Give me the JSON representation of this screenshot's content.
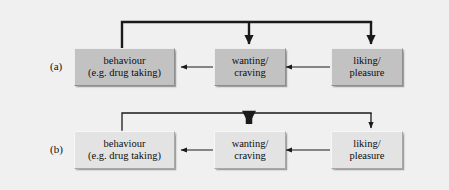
{
  "figure": {
    "background_color": "#f0f0f0",
    "width": 449,
    "height": 190,
    "stroke_color": "#1a1a1a",
    "box_fill_dark": "#c2c2c2",
    "box_fill_light": "#e3e3e3"
  },
  "rows": [
    {
      "id": "a",
      "label": "(a)",
      "tone": "dark",
      "nodes": [
        {
          "id": "behaviour",
          "line1": "behaviour",
          "line2": "(e.g. drug taking)"
        },
        {
          "id": "wanting",
          "line1": "wanting/",
          "line2": "craving"
        },
        {
          "id": "liking",
          "line1": "liking/",
          "line2": "pleasure"
        }
      ],
      "arrow_weights": {
        "liking_to_wanting": "thin",
        "wanting_to_behaviour": "thin",
        "feedback_trunk": "thick",
        "feedback_to_wanting": "thick",
        "feedback_to_liking": "thick"
      }
    },
    {
      "id": "b",
      "label": "(b)",
      "tone": "light",
      "nodes": [
        {
          "id": "behaviour",
          "line1": "behaviour",
          "line2": "(e.g. drug taking)"
        },
        {
          "id": "wanting",
          "line1": "wanting/",
          "line2": "craving"
        },
        {
          "id": "liking",
          "line1": "liking/",
          "line2": "pleasure"
        }
      ],
      "arrow_weights": {
        "liking_to_wanting": "thin",
        "wanting_to_behaviour": "thin",
        "feedback_trunk": "thin",
        "feedback_to_wanting": "very-thick",
        "feedback_to_liking": "thin"
      }
    }
  ]
}
